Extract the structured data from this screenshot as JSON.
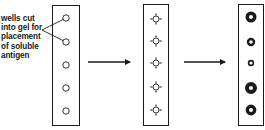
{
  "diagram": {
    "annotation": {
      "lines": [
        "wells cut",
        "into gel for",
        "placement",
        "of soluble",
        "antigen"
      ],
      "text": "wells cut\ninto gel for\nplacement\nof soluble\nantigen",
      "points_to_wells": [
        0,
        1
      ]
    },
    "stages": [
      {
        "name": "empty-wells",
        "strip": {
          "x": 52,
          "y": 5,
          "w": 27,
          "h": 120
        },
        "wells": [
          {
            "cy": 18,
            "r": 3.2
          },
          {
            "cy": 42,
            "r": 3.2
          },
          {
            "cy": 65,
            "r": 3.2
          },
          {
            "cy": 88,
            "r": 3.2
          },
          {
            "cy": 111,
            "r": 3.2
          }
        ],
        "style": "open-circle"
      },
      {
        "name": "diffusing-wells",
        "strip": {
          "x": 143,
          "y": 4,
          "w": 25,
          "h": 121
        },
        "wells": [
          {
            "cy": 19,
            "r": 3
          },
          {
            "cy": 41,
            "r": 3
          },
          {
            "cy": 63,
            "r": 3
          },
          {
            "cy": 87,
            "r": 3
          },
          {
            "cy": 110,
            "r": 3
          }
        ],
        "style": "circle-with-radial-ticks"
      },
      {
        "name": "precipitin-rings",
        "strip": {
          "x": 238,
          "y": 4,
          "w": 25,
          "h": 121
        },
        "wells": [
          {
            "cy": 17,
            "outer": 5.5,
            "inner": 2
          },
          {
            "cy": 42,
            "outer": 4.2,
            "inner": 1.8
          },
          {
            "cy": 63,
            "outer": 3.2,
            "inner": 1.6
          },
          {
            "cy": 88,
            "outer": 6,
            "inner": 2
          },
          {
            "cy": 110,
            "outer": 5.4,
            "inner": 2
          }
        ],
        "style": "filled-ring"
      }
    ],
    "arrows": [
      {
        "x1": 88,
        "x2": 134,
        "y": 62
      },
      {
        "x1": 184,
        "x2": 229,
        "y": 62
      }
    ],
    "colors": {
      "ink": "#1a1a1a",
      "background": "#ffffff"
    }
  }
}
